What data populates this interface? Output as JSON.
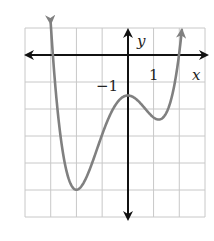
{
  "chart_data": {
    "type": "line",
    "title": "",
    "xlabel": "x",
    "ylabel": "y",
    "xlim": [
      -4,
      3
    ],
    "ylim": [
      -6,
      1
    ],
    "grid": true,
    "tick_labels": {
      "x": [
        "1"
      ],
      "y": [
        "-1"
      ]
    },
    "tick_label_display": {
      "x_one": "1",
      "y_minus_one": "−1"
    },
    "series": [
      {
        "name": "f(x)",
        "description": "Quartic curve with arrows at both ends; local minimum near (-2, -5), local maximum near (0, -1.5), local minimum near (1.2, -2)",
        "key_points": [
          {
            "x": -3.0,
            "y": 1.0
          },
          {
            "x": -2.9,
            "y": 0.0
          },
          {
            "x": -2.0,
            "y": -5.0
          },
          {
            "x": -1.0,
            "y": -3.0
          },
          {
            "x": 0.0,
            "y": -1.5
          },
          {
            "x": 1.2,
            "y": -2.0
          },
          {
            "x": 2.0,
            "y": 0.0
          },
          {
            "x": 2.1,
            "y": 1.0
          }
        ],
        "color": "#808080"
      }
    ],
    "colors": {
      "curve": "#808080",
      "axes": "#111111",
      "grid": "#c8c8c8"
    }
  }
}
